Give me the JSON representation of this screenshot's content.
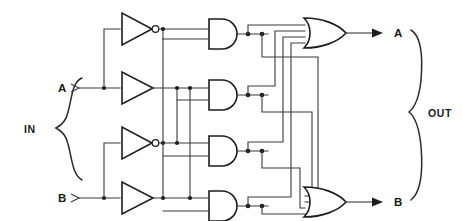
{
  "diagram": {
    "background_color": "#ffffff",
    "line_color": "#3a3a3a",
    "gate_outline_color": "#1d1d1d"
  },
  "groups": {
    "input_group_label": "IN",
    "output_group_label": "OUT"
  },
  "input_pins": [
    {
      "label": "A",
      "x": 63,
      "y": 88
    },
    {
      "label": "B",
      "x": 63,
      "y": 198
    }
  ],
  "output_pins": [
    {
      "label": "A",
      "x": 398,
      "y": 33
    },
    {
      "label": "B",
      "x": 398,
      "y": 202
    }
  ],
  "buffers": [
    {
      "name": "inverter-a-top",
      "type": "inverter",
      "inverted": true,
      "y": 29,
      "x": 120
    },
    {
      "name": "buffer-a",
      "type": "buffer",
      "inverted": false,
      "y": 88,
      "x": 120
    },
    {
      "name": "inverter-b-top",
      "type": "inverter",
      "inverted": true,
      "y": 143,
      "x": 120
    },
    {
      "name": "buffer-b",
      "type": "buffer",
      "inverted": false,
      "y": 198,
      "x": 120
    }
  ],
  "and_gates": [
    {
      "name": "and-gate-1",
      "type": "and",
      "y": 31,
      "x": 208
    },
    {
      "name": "and-gate-2",
      "type": "and",
      "y": 92,
      "x": 208
    },
    {
      "name": "and-gate-3",
      "type": "and",
      "y": 148,
      "x": 208
    },
    {
      "name": "and-gate-4",
      "type": "and",
      "y": 203,
      "x": 208
    }
  ],
  "or_gates": [
    {
      "name": "or-gate-top",
      "type": "or",
      "inputs": 4,
      "y": 33,
      "x": 323
    },
    {
      "name": "or-gate-bottom",
      "type": "or",
      "inputs": 4,
      "y": 202,
      "x": 323
    }
  ],
  "counts": {
    "inverters": 2,
    "buffers": 2,
    "and_gates": 4,
    "or_gates": 2,
    "inputs": 2,
    "outputs": 2
  }
}
